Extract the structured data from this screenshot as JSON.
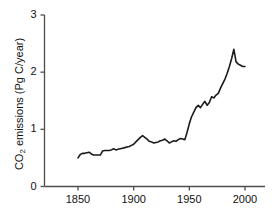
{
  "chart_data": {
    "type": "line",
    "title": "",
    "subtitle": "",
    "xlabel": "",
    "ylabel": "CO2 emissions (Pg C/year)",
    "ylabel_parts": {
      "prefix": "CO",
      "sub": "2",
      "suffix": " emissions (Pg C/year)"
    },
    "xlim": [
      1820,
      2020
    ],
    "ylim": [
      0,
      3
    ],
    "xticks": [
      1850,
      1900,
      1950,
      2000
    ],
    "xtick_labels": [
      "1850",
      "1900",
      "1950",
      "2000"
    ],
    "yticks": [
      0,
      1,
      2,
      3
    ],
    "ytick_labels": [
      "0",
      "1",
      "2",
      "3"
    ],
    "grid": false,
    "legend": null,
    "legend_position": "none",
    "line_color": "#1a1a1a",
    "line_width": 1.6,
    "axis_color": "#4d4d4d",
    "background_color": "#ffffff",
    "series": [
      {
        "name": "CO2 emissions",
        "x": [
          1850,
          1852,
          1854,
          1856,
          1858,
          1860,
          1862,
          1864,
          1866,
          1868,
          1870,
          1872,
          1874,
          1876,
          1878,
          1880,
          1882,
          1884,
          1886,
          1888,
          1890,
          1892,
          1894,
          1896,
          1898,
          1900,
          1902,
          1904,
          1906,
          1908,
          1910,
          1912,
          1914,
          1916,
          1918,
          1920,
          1922,
          1924,
          1926,
          1928,
          1930,
          1932,
          1934,
          1936,
          1938,
          1940,
          1942,
          1944,
          1946,
          1948,
          1950,
          1952,
          1954,
          1956,
          1958,
          1960,
          1962,
          1964,
          1966,
          1968,
          1970,
          1972,
          1974,
          1976,
          1978,
          1980,
          1982,
          1984,
          1986,
          1988,
          1990,
          1992,
          1994,
          1996,
          1998,
          2000
        ],
        "y": [
          0.5,
          0.56,
          0.58,
          0.58,
          0.59,
          0.6,
          0.57,
          0.55,
          0.55,
          0.55,
          0.55,
          0.62,
          0.63,
          0.63,
          0.63,
          0.64,
          0.66,
          0.64,
          0.65,
          0.66,
          0.67,
          0.68,
          0.69,
          0.7,
          0.72,
          0.74,
          0.78,
          0.82,
          0.86,
          0.89,
          0.86,
          0.83,
          0.79,
          0.78,
          0.76,
          0.77,
          0.78,
          0.8,
          0.81,
          0.83,
          0.8,
          0.76,
          0.78,
          0.8,
          0.79,
          0.82,
          0.84,
          0.83,
          0.82,
          0.95,
          1.1,
          1.22,
          1.3,
          1.38,
          1.42,
          1.38,
          1.44,
          1.49,
          1.42,
          1.47,
          1.57,
          1.55,
          1.6,
          1.63,
          1.72,
          1.8,
          1.88,
          1.98,
          2.1,
          2.24,
          2.4,
          2.18,
          2.14,
          2.12,
          2.1,
          2.1
        ]
      }
    ],
    "annotations": []
  },
  "axes": {
    "y_axis_name": "y-axis",
    "x_axis_name": "x-axis"
  }
}
